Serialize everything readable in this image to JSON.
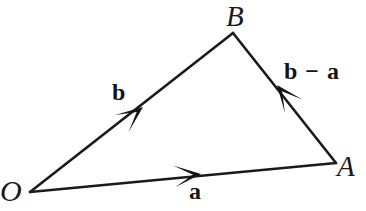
{
  "figure": {
    "kind": "vector-triangle-diagram",
    "background_color": "#ffffff",
    "stroke_color": "#1a1a1a",
    "text_color": "#141414"
  },
  "points": {
    "O": {
      "label": "O",
      "x": 30,
      "y": 192
    },
    "B": {
      "label": "B",
      "x": 233,
      "y": 33
    },
    "A": {
      "label": "A",
      "x": 336,
      "y": 163
    }
  },
  "vectors": [
    {
      "name": "vector-b",
      "label": "b",
      "from": "O",
      "to": "B",
      "arrow_at_fraction": 0.48,
      "arrow_direction": "up-right"
    },
    {
      "name": "vector-a",
      "label": "a",
      "from": "O",
      "to": "A",
      "arrow_at_fraction": 0.56,
      "arrow_direction": "right"
    },
    {
      "name": "vector-b-minus-a",
      "label": "b − a",
      "from": "A",
      "to": "B",
      "arrow_at_fraction": 0.56,
      "arrow_direction": "up-left"
    }
  ],
  "geometry": {
    "segments": [
      {
        "name": "segment-OB",
        "x1": 30,
        "y1": 192,
        "x2": 233,
        "y2": 33
      },
      {
        "name": "segment-OA",
        "x1": 30,
        "y1": 192,
        "x2": 336,
        "y2": 163
      },
      {
        "name": "segment-BA",
        "x1": 233,
        "y1": 33,
        "x2": 336,
        "y2": 163
      }
    ],
    "arrowheads": [
      {
        "name": "arrowhead-b",
        "tip_x": 143,
        "tip_y": 107,
        "angle_deg": -38
      },
      {
        "name": "arrowhead-a",
        "tip_x": 201,
        "tip_y": 174,
        "angle_deg": -5
      },
      {
        "name": "arrowhead-b-minus-a",
        "tip_x": 277,
        "tip_y": 85,
        "angle_deg": 232
      }
    ]
  }
}
